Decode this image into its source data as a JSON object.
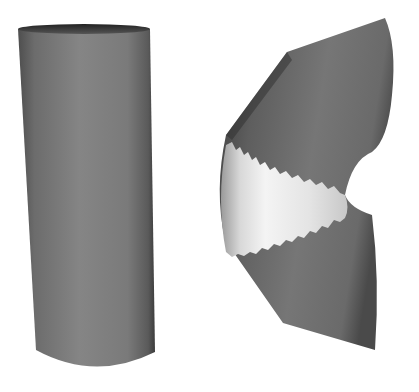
{
  "scene": {
    "description": "Rendered 3D shapes: a straight cylinder and a bent tube with a highlighted middle band",
    "background": "#ffffff",
    "objects": [
      {
        "name": "cylinder",
        "color_body": "#7a7a7a",
        "color_dark": "#3a3a3a"
      },
      {
        "name": "bent-tube",
        "color_body": "#6e6e6e",
        "color_band": "#e6e6e6",
        "color_dark": "#3c3c3c"
      }
    ]
  }
}
